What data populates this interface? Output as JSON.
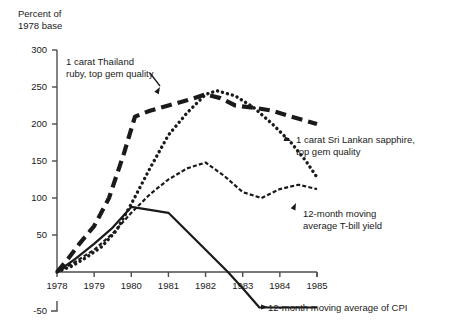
{
  "chart_data": {
    "type": "line",
    "title": "",
    "ylabel": "Percent of 1978 base",
    "xlabel": "",
    "xlim": [
      1978,
      1985
    ],
    "ylim": [
      -50,
      300
    ],
    "grid": false,
    "legend_position": "inline-annotations",
    "x_tick_labels": [
      "1978",
      "1979",
      "1980",
      "1981",
      "1982",
      "1983",
      "1984",
      "1985"
    ],
    "y_tick_labels": [
      "300",
      "250",
      "200",
      "150",
      "100",
      "50",
      "-50"
    ],
    "y_ticks": [
      300,
      250,
      200,
      150,
      100,
      50,
      -50
    ],
    "axis_break_note": "y-axis is broken between 0 and -50",
    "series": [
      {
        "name": "1 carat Thailand ruby, top gem quality",
        "style": "thick-dashed",
        "x": [
          1978,
          1978.3,
          1978.6,
          1979,
          1979.4,
          1979.8,
          1980.1,
          1980.5,
          1981,
          1981.5,
          1982,
          1982.4,
          1982.8,
          1983.3,
          1983.8,
          1984.3,
          1985
        ],
        "values": [
          0,
          18,
          38,
          62,
          100,
          160,
          210,
          218,
          225,
          232,
          240,
          235,
          225,
          222,
          218,
          210,
          200
        ]
      },
      {
        "name": "1 carat Sri Lankan sapphire, top gem quality",
        "style": "dotted",
        "x": [
          1978,
          1978.4,
          1978.8,
          1979.2,
          1979.6,
          1980,
          1980.5,
          1981,
          1981.5,
          1982,
          1982.3,
          1982.8,
          1983.3,
          1983.8,
          1984.3,
          1984.7,
          1985
        ],
        "values": [
          0,
          8,
          20,
          34,
          56,
          92,
          140,
          185,
          215,
          240,
          245,
          238,
          222,
          200,
          175,
          150,
          128
        ]
      },
      {
        "name": "12-month moving average T-bill yield",
        "style": "fine-dashed",
        "x": [
          1978,
          1978.5,
          1979,
          1979.5,
          1980,
          1980.5,
          1981,
          1981.5,
          1982,
          1982.5,
          1983,
          1983.5,
          1984,
          1984.5,
          1985
        ],
        "values": [
          0,
          14,
          30,
          52,
          80,
          105,
          125,
          140,
          148,
          130,
          108,
          100,
          112,
          118,
          112
        ]
      },
      {
        "name": "12-month moving average of CPI",
        "style": "solid",
        "x": [
          1978,
          1978.5,
          1979,
          1979.5,
          1980,
          1981,
          1982,
          1982.6,
          1983,
          1983.45,
          1985
        ],
        "values": [
          0,
          18,
          38,
          60,
          88,
          80,
          30,
          0,
          -22,
          -48,
          -48
        ]
      }
    ]
  },
  "annotations": {
    "axis_title": "Percent of\n1978 base",
    "ruby": "1 carat Thailand\nruby, top gem quality",
    "sapphire": "1 carat Sri Lankan sapphire,\ntop gem quality",
    "tbill": "12-month moving\naverage T-bill yield",
    "cpi": "12-month moving average of CPI"
  },
  "colors": {
    "ink": "#1a1a1a",
    "axis": "#4d4d4d",
    "background": "#ffffff"
  }
}
